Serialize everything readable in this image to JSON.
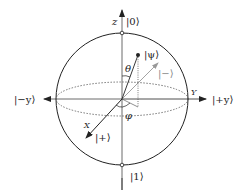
{
  "diagram": {
    "colors": {
      "line": "#222222",
      "gray_vector": "#888888",
      "dotted": "#555555",
      "background": "#ffffff"
    },
    "axes": {
      "z": {
        "label": "z",
        "top_state": "|0⟩",
        "bottom_state": "|1⟩"
      },
      "y": {
        "label": "Y",
        "positive_state": "|+y⟩",
        "negative_state": "|−y⟩"
      },
      "x": {
        "label": "X",
        "positive_state": "|+⟩"
      }
    },
    "vectors": {
      "psi": {
        "label": "|ψ⟩"
      },
      "minus": {
        "label": "|−⟩"
      }
    },
    "angles": {
      "theta": "θ",
      "phi": "φ"
    }
  }
}
